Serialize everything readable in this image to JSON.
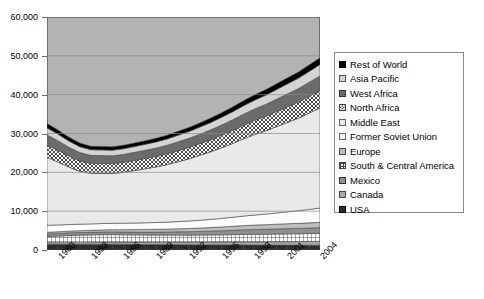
{
  "chart_data": {
    "type": "area",
    "title": "",
    "subtitle": "",
    "xlabel": "",
    "ylabel": "",
    "stacked": true,
    "grid": true,
    "legend_position": "right",
    "ylim": [
      0,
      60000
    ],
    "ytick_labels": [
      "0",
      "10,000",
      "20,000",
      "30,000",
      "40,000",
      "50,000",
      "60,000"
    ],
    "ytick_values": [
      0,
      10000,
      20000,
      30000,
      40000,
      50000,
      60000
    ],
    "xlim": [
      1979,
      2004
    ],
    "xtick_labels": [
      "1980",
      "1983",
      "1986",
      "1989",
      "1992",
      "1995",
      "1998",
      "2001",
      "2004"
    ],
    "xtick_values": [
      1980,
      1983,
      1986,
      1989,
      1992,
      1995,
      1998,
      2001,
      2004
    ],
    "x": [
      1979,
      1980,
      1981,
      1982,
      1983,
      1984,
      1985,
      1986,
      1987,
      1988,
      1989,
      1990,
      1991,
      1992,
      1993,
      1994,
      1995,
      1996,
      1997,
      1998,
      1999,
      2000,
      2001,
      2002,
      2003,
      2004
    ],
    "series": [
      {
        "name": "USA",
        "pattern": "near-black",
        "color": "#2b2b2b",
        "values": [
          1500,
          1480,
          1460,
          1450,
          1460,
          1480,
          1500,
          1470,
          1450,
          1430,
          1400,
          1390,
          1380,
          1360,
          1350,
          1340,
          1330,
          1330,
          1320,
          1300,
          1280,
          1280,
          1270,
          1260,
          1250,
          1240
        ]
      },
      {
        "name": "Canada",
        "pattern": "gray",
        "color": "#a8a8a8",
        "values": [
          400,
          410,
          420,
          430,
          450,
          470,
          490,
          500,
          520,
          540,
          560,
          580,
          600,
          620,
          650,
          680,
          700,
          730,
          760,
          790,
          810,
          840,
          860,
          900,
          940,
          980
        ]
      },
      {
        "name": "Mexico",
        "pattern": "grid",
        "color": "#ffffff",
        "values": [
          1550,
          1700,
          1850,
          1950,
          1980,
          1990,
          1980,
          1950,
          1920,
          1900,
          1880,
          1870,
          1860,
          1850,
          1850,
          1860,
          1880,
          1900,
          1930,
          1950,
          1960,
          1980,
          2000,
          2020,
          2040,
          2060
        ]
      },
      {
        "name": "South & Central America",
        "pattern": "med-dark",
        "color": "#8f8f8f",
        "values": [
          700,
          690,
          680,
          670,
          670,
          680,
          690,
          700,
          720,
          740,
          770,
          800,
          840,
          880,
          930,
          980,
          1040,
          1100,
          1170,
          1230,
          1270,
          1320,
          1360,
          1380,
          1420,
          1460
        ]
      },
      {
        "name": "Europe",
        "pattern": "mid-gray",
        "color": "#bdbdbd",
        "values": [
          400,
          420,
          440,
          470,
          500,
          540,
          580,
          620,
          650,
          680,
          710,
          740,
          780,
          820,
          870,
          920,
          980,
          1040,
          1100,
          1150,
          1190,
          1230,
          1270,
          1300,
          1340,
          1380
        ]
      },
      {
        "name": "Former Soviet Union",
        "pattern": "white",
        "color": "#fbfbfb",
        "values": [
          1800,
          1750,
          1700,
          1680,
          1660,
          1650,
          1640,
          1660,
          1690,
          1720,
          1760,
          1800,
          1860,
          1930,
          2010,
          2100,
          2200,
          2320,
          2450,
          2580,
          2720,
          2880,
          3060,
          3250,
          3460,
          3680
        ]
      },
      {
        "name": "Middle East",
        "pattern": "pale",
        "color": "#e9e9e9",
        "values": [
          17500,
          16200,
          14800,
          13600,
          13000,
          12900,
          12800,
          13100,
          13500,
          13900,
          14300,
          14800,
          15400,
          16000,
          16700,
          17400,
          18200,
          19000,
          19900,
          20700,
          21400,
          22200,
          23000,
          23800,
          24800,
          25800
        ]
      },
      {
        "name": "North Africa",
        "pattern": "checker",
        "color": "#ffffff",
        "values": [
          3200,
          3050,
          2850,
          2700,
          2600,
          2580,
          2560,
          2580,
          2620,
          2660,
          2720,
          2780,
          2860,
          2940,
          3030,
          3130,
          3240,
          3360,
          3490,
          3620,
          3740,
          3880,
          4020,
          4160,
          4320,
          4480
        ]
      },
      {
        "name": "West Africa",
        "pattern": "dark-gray",
        "color": "#6b6b6b",
        "values": [
          2600,
          2450,
          2280,
          2150,
          2050,
          2030,
          2010,
          2030,
          2070,
          2110,
          2160,
          2220,
          2290,
          2360,
          2440,
          2530,
          2630,
          2740,
          2860,
          2980,
          3090,
          3210,
          3340,
          3460,
          3600,
          3750
        ]
      },
      {
        "name": "Asia Pacific",
        "pattern": "light-gray",
        "color": "#d4d4d4",
        "values": [
          1800,
          1700,
          1600,
          1520,
          1470,
          1460,
          1450,
          1470,
          1500,
          1540,
          1580,
          1630,
          1690,
          1750,
          1820,
          1900,
          1990,
          2080,
          2180,
          2280,
          2370,
          2470,
          2580,
          2680,
          2800,
          2920
        ]
      },
      {
        "name": "Rest of World",
        "pattern": "solid-black",
        "color": "#000000",
        "values": [
          1100,
          1050,
          980,
          920,
          880,
          870,
          860,
          870,
          890,
          910,
          940,
          970,
          1000,
          1040,
          1080,
          1130,
          1180,
          1240,
          1300,
          1360,
          1410,
          1470,
          1530,
          1590,
          1660,
          1730
        ]
      }
    ],
    "totals": [
      32550,
      31100,
      29460,
      28140,
      27720,
      27650,
      27560,
      27950,
      28530,
      29130,
      29780,
      30580,
      31560,
      32510,
      33730,
      35000,
      36370,
      37840,
      39460,
      40940,
      42240,
      43760,
      45290,
      46810,
      48630,
      50480
    ]
  },
  "legend": {
    "items": [
      {
        "label": "Rest of World",
        "swatch": "solid-black"
      },
      {
        "label": "Asia Pacific",
        "swatch": "light-gray"
      },
      {
        "label": "West Africa",
        "swatch": "dark-gray"
      },
      {
        "label": "North Africa",
        "swatch": "checker"
      },
      {
        "label": "Middle East",
        "swatch": "pale"
      },
      {
        "label": "Former Soviet Union",
        "swatch": "white"
      },
      {
        "label": "Europe",
        "swatch": "mid-gray"
      },
      {
        "label": "South & Central America",
        "swatch": "grid"
      },
      {
        "label": "Mexico",
        "swatch": "med-dark"
      },
      {
        "label": "Canada",
        "swatch": "gray"
      },
      {
        "label": "USA",
        "swatch": "near-black"
      }
    ]
  },
  "colors": {
    "plot_background": "#b3b3b3",
    "gridline": "#8a8a8a",
    "axis": "#6e6e6e",
    "text": "#000000"
  }
}
